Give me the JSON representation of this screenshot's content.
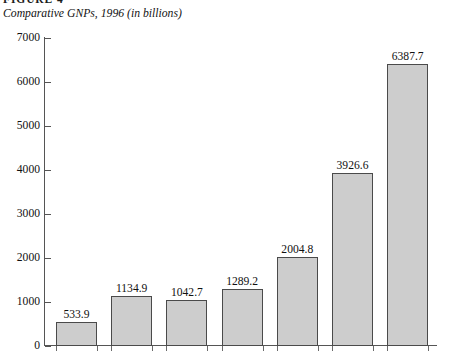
{
  "figure": {
    "heading": "FIGURE 4",
    "subtitle": "Comparative GNPs, 1996 (in billions)"
  },
  "chart_data": {
    "type": "bar",
    "title": "Comparative GNPs, 1996 (in billions)",
    "xlabel": "",
    "ylabel": "",
    "ylim": [
      0,
      7000
    ],
    "ytick_labels": [
      "0",
      "1000",
      "2000",
      "3000",
      "4000",
      "5000",
      "6000",
      "7000"
    ],
    "ytick_values": [
      0,
      1000,
      2000,
      3000,
      4000,
      5000,
      6000,
      7000
    ],
    "grid": false,
    "legend": "none",
    "categories": [
      "",
      "",
      "",
      "",
      "",
      "",
      ""
    ],
    "values": [
      533.9,
      1134.9,
      1042.7,
      1289.2,
      2004.8,
      3926.6,
      6387.7
    ],
    "data_labels": [
      "533.9",
      "1134.9",
      "1042.7",
      "1289.2",
      "2004.8",
      "3926.6",
      "6387.7"
    ],
    "bar_fill_color": "#cdcdcd",
    "bar_border_color": "#4a4a4a",
    "axis_color": "#555555"
  }
}
